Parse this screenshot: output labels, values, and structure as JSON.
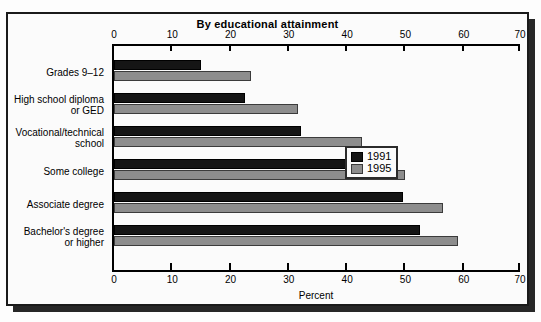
{
  "chart_data": {
    "type": "bar",
    "orientation": "horizontal",
    "title": "By educational attainment",
    "xlabel": "Percent",
    "ylabel": "",
    "xlim": [
      0,
      70
    ],
    "xticks": [
      0,
      10,
      20,
      30,
      40,
      50,
      60,
      70
    ],
    "xtick_labels": [
      "0",
      "10",
      "20",
      "30",
      "40",
      "50",
      "60",
      "70"
    ],
    "grid": false,
    "legend_position": "center-right",
    "categories": [
      "Grades 9–12",
      "High school diploma\nor GED",
      "Vocational/technical\nschool",
      "Some college",
      "Associate degree",
      "Bachelor's degree\nor higher"
    ],
    "category_lines": [
      [
        "Grades 9–12"
      ],
      [
        "High school diploma",
        "or GED"
      ],
      [
        "Vocational/technical",
        "school"
      ],
      [
        "Some college"
      ],
      [
        "Associate degree"
      ],
      [
        "Bachelor's degree",
        "or higher"
      ]
    ],
    "series": [
      {
        "name": "1991",
        "color": "#151515",
        "values": [
          15,
          22.5,
          32,
          40.5,
          49.5,
          52.5
        ]
      },
      {
        "name": "1995",
        "color": "#8d8d8d",
        "values": [
          23.5,
          31.5,
          42.5,
          50,
          56.5,
          59
        ]
      }
    ]
  },
  "legend": {
    "entries": [
      {
        "label": "1991",
        "swatch": "black"
      },
      {
        "label": "1995",
        "swatch": "gray"
      }
    ]
  },
  "axis": {
    "caption": "Percent"
  }
}
